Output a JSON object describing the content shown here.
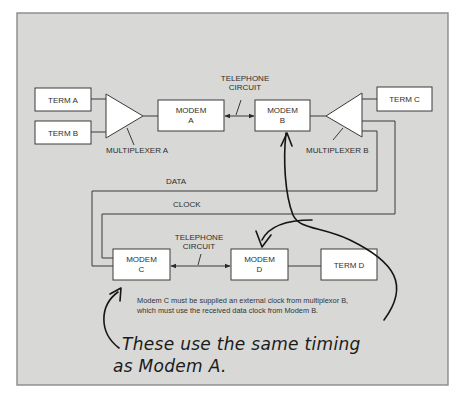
{
  "diagram": {
    "nodes": {
      "term_a": "TERM A",
      "term_b": "TERM B",
      "term_c": "TERM C",
      "term_d": "TERM D",
      "modem_a": [
        "MODEM",
        "A"
      ],
      "modem_b": [
        "MODEM",
        "B"
      ],
      "modem_c": [
        "MODEM",
        "C"
      ],
      "modem_d": [
        "MODEM",
        "D"
      ],
      "multiplexer_a": "MULTIPLEXER A",
      "multiplexer_b": "MULTIPLEXER B"
    },
    "links": {
      "telephone_circuit_top": [
        "TELEPHONE",
        "CIRCUIT"
      ],
      "telephone_circuit_bottom": [
        "TELEPHONE",
        "CIRCUIT"
      ],
      "data": "DATA",
      "clock": "CLOCK"
    },
    "note": [
      "Modem C must be supplied an external clock from multiplexor B,",
      "which must use the received data clock from Modem B."
    ],
    "handwritten_annotation": [
      "These use the same timing",
      "as Modem A."
    ],
    "colors": {
      "panel": "#d8d8d6",
      "panel_border": "#8a8a8a",
      "box_fill": "#ffffff",
      "line": "#3a3a3a",
      "ink": "#151515"
    }
  }
}
